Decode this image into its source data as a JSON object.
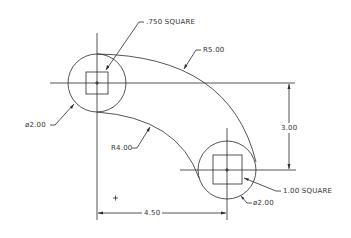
{
  "drawing": {
    "colors": {
      "line": "#2a2a2a",
      "background": "#ffffff",
      "text": "#333333"
    },
    "annotations": {
      "left_square": ".750 SQUARE",
      "outer_radius": "R5.00",
      "left_diameter": "ø2.00",
      "inner_radius": "R4.00",
      "vertical_dim": "3.00",
      "right_square": "1.00 SQUARE",
      "right_diameter": "ø2.00",
      "horizontal_dim": "4.50"
    },
    "marks": {
      "origin_cross": "+"
    }
  }
}
